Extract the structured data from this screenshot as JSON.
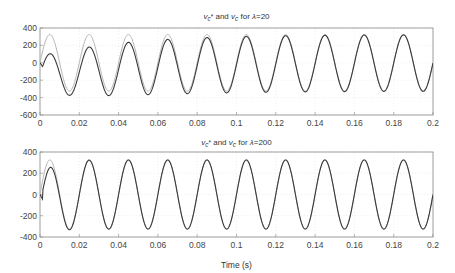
{
  "colors": {
    "reference": "#b5b5b5",
    "actual": "#3a3a3a",
    "axes": "#888888",
    "grid": "#dddddd"
  },
  "chart_data": [
    {
      "type": "line",
      "title_parts": {
        "v1": "v",
        "sub1": "c",
        "star": "*",
        "and": " and ",
        "v2": "v",
        "sub2": "c",
        "for": " for ",
        "lambda": "λ",
        "eq": "=20"
      },
      "title": "vc* and vc for λ=20",
      "xlabel": "",
      "ylabel": "",
      "xlim": [
        0,
        0.2
      ],
      "ylim": [
        -600,
        400
      ],
      "xticks": [
        0,
        0.02,
        0.04,
        0.06,
        0.08,
        0.1,
        0.12,
        0.14,
        0.16,
        0.18,
        0.2
      ],
      "xtick_labels": [
        "0",
        "0.02",
        "0.04",
        "0.06",
        "0.08",
        "0.1",
        "0.12",
        "0.14",
        "0.16",
        "0.18",
        "0.2"
      ],
      "yticks": [
        400,
        200,
        0,
        -200,
        -400,
        -600
      ],
      "ytick_labels": [
        "400",
        "200",
        "0",
        "-200",
        "-400",
        "-600"
      ],
      "grid": true,
      "series": [
        {
          "name": "vc* (reference)",
          "amplitude": 325,
          "frequency_hz": 50,
          "offset_initial": 0,
          "decay_tau": 0
        },
        {
          "name": "vc (actual)",
          "amplitude": 325,
          "frequency_hz": 50,
          "offset_initial": -200,
          "decay_tau": 0.045
        }
      ]
    },
    {
      "type": "line",
      "title_parts": {
        "v1": "v",
        "sub1": "c",
        "star": "*",
        "and": " and ",
        "v2": "v",
        "sub2": "c",
        "for": " for ",
        "lambda": "λ",
        "eq": "=200"
      },
      "title": "vc* and vc for λ=200",
      "xlabel": "Time (s)",
      "ylabel": "",
      "xlim": [
        0,
        0.2
      ],
      "ylim": [
        -400,
        400
      ],
      "xticks": [
        0,
        0.02,
        0.04,
        0.06,
        0.08,
        0.1,
        0.12,
        0.14,
        0.16,
        0.18,
        0.2
      ],
      "xtick_labels": [
        "0",
        "0.02",
        "0.04",
        "0.06",
        "0.08",
        "0.1",
        "0.12",
        "0.14",
        "0.16",
        "0.18",
        "0.2"
      ],
      "yticks": [
        400,
        200,
        0,
        -200,
        -400
      ],
      "ytick_labels": [
        "400",
        "200",
        "0",
        "-200",
        "-400"
      ],
      "grid": true,
      "series": [
        {
          "name": "vc* (reference)",
          "amplitude": 325,
          "frequency_hz": 50,
          "offset_initial": 0,
          "decay_tau": 0
        },
        {
          "name": "vc (actual)",
          "amplitude": 325,
          "frequency_hz": 50,
          "offset_initial": -110,
          "decay_tau": 0.006
        }
      ]
    }
  ],
  "plots_layout": [
    {
      "left": 40,
      "right": 433,
      "top": 28,
      "bottom": 115,
      "title_y": 19
    },
    {
      "left": 40,
      "right": 433,
      "top": 152,
      "bottom": 237,
      "title_y": 145,
      "xlabel_y": 268
    }
  ]
}
